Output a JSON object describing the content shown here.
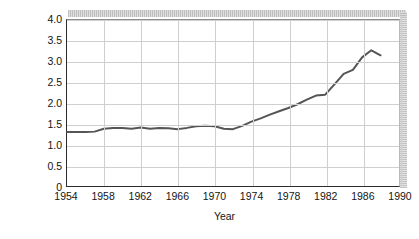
{
  "chart_data": {
    "type": "line",
    "title": "",
    "xlabel": "Year",
    "ylabel_line1": "Interest on national debt held",
    "ylabel_line2": "by public (percentage of GNP)",
    "ylabel": "Interest on national debt held by public (percentage of GNP)",
    "xlim": [
      1954,
      1990
    ],
    "ylim": [
      0,
      4.0
    ],
    "xticks": [
      "1954",
      "1958",
      "1962",
      "1966",
      "1970",
      "1974",
      "1978",
      "1982",
      "1986",
      "1990"
    ],
    "xtick_values": [
      1954,
      1958,
      1962,
      1966,
      1970,
      1974,
      1978,
      1982,
      1986,
      1990
    ],
    "yticks": [
      "0",
      "0.5",
      "1.0",
      "1.5",
      "2.0",
      "2.5",
      "3.0",
      "3.5",
      "4.0"
    ],
    "ytick_values": [
      0,
      0.5,
      1.0,
      1.5,
      2.0,
      2.5,
      3.0,
      3.5,
      4.0
    ],
    "grid": true,
    "legend": "none",
    "line_color": "#555555",
    "grid_color": "#cfcfcf",
    "axis_color": "#2b2b2b",
    "x": [
      1954,
      1955,
      1956,
      1957,
      1958,
      1959,
      1960,
      1961,
      1962,
      1963,
      1964,
      1965,
      1966,
      1967,
      1968,
      1969,
      1970,
      1971,
      1972,
      1973,
      1974,
      1975,
      1976,
      1977,
      1978,
      1979,
      1980,
      1981,
      1982,
      1983,
      1984,
      1985,
      1986,
      1987,
      1988
    ],
    "values": [
      1.3,
      1.3,
      1.3,
      1.31,
      1.38,
      1.4,
      1.4,
      1.38,
      1.41,
      1.38,
      1.4,
      1.39,
      1.37,
      1.4,
      1.44,
      1.45,
      1.44,
      1.38,
      1.37,
      1.45,
      1.55,
      1.63,
      1.72,
      1.8,
      1.88,
      1.97,
      2.08,
      2.18,
      2.2,
      2.45,
      2.7,
      2.8,
      3.1,
      3.27,
      3.15
    ],
    "series": [
      {
        "name": "Interest on national debt held by public",
        "values": [
          1.3,
          1.3,
          1.3,
          1.31,
          1.38,
          1.4,
          1.4,
          1.38,
          1.41,
          1.38,
          1.4,
          1.39,
          1.37,
          1.4,
          1.44,
          1.45,
          1.44,
          1.38,
          1.37,
          1.45,
          1.55,
          1.63,
          1.72,
          1.8,
          1.88,
          1.97,
          2.08,
          2.18,
          2.2,
          2.45,
          2.7,
          2.8,
          3.1,
          3.27,
          3.15
        ]
      }
    ]
  }
}
